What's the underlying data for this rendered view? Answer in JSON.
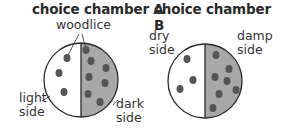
{
  "chambers": [
    {
      "title": "choice chamber A",
      "pointer_label": "woodlice",
      "left_label": [
        "light",
        "side"
      ],
      "right_label": [
        "dark",
        "side"
      ],
      "left_count": 3,
      "right_count": 7,
      "right_fill": "#a8a8a8"
    },
    {
      "title": "choice chamber B",
      "left_label": [
        "dry",
        "side"
      ],
      "right_label": [
        "damp",
        "side"
      ],
      "left_count": 3,
      "right_count": 7,
      "right_fill": "#a8a8a8"
    }
  ]
}
